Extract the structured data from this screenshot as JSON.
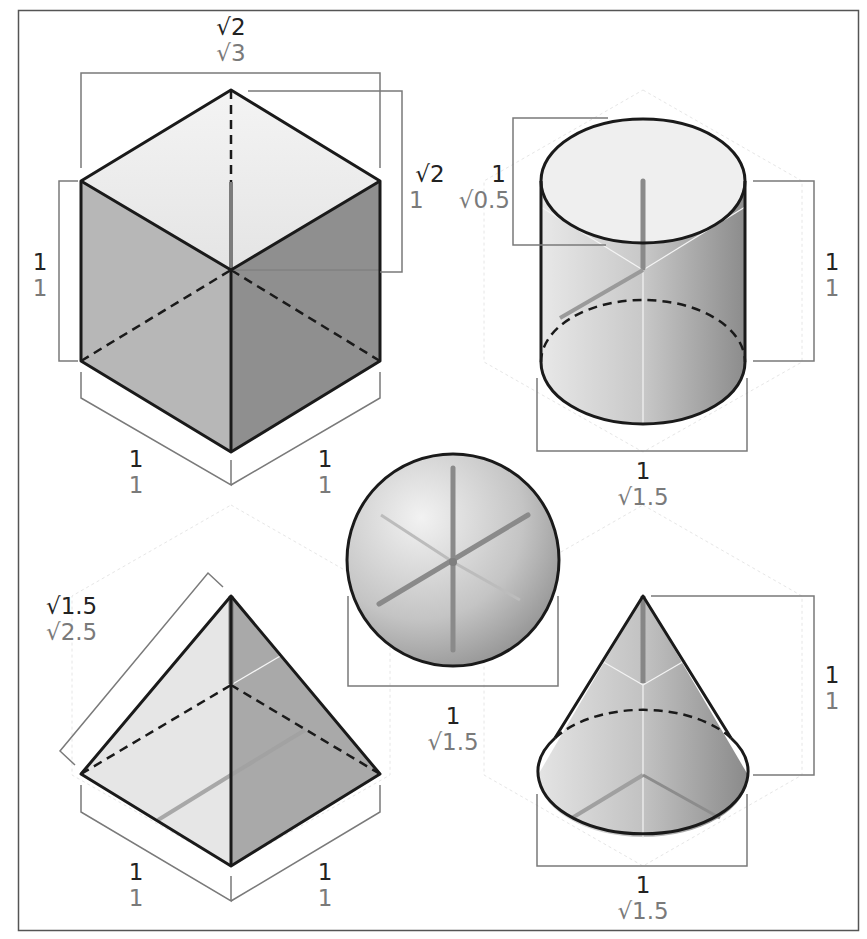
{
  "colors": {
    "frame": "#555555",
    "edge": "#1a1a1a",
    "dim_line": "#7a7a7a",
    "label_primary": "#222222",
    "label_secondary": "#7a7a7a",
    "face_light": "#ececec",
    "face_mid": "#b9b9b9",
    "face_dark": "#8f8f8f",
    "axis": "#8a8a8a"
  },
  "shapes": {
    "cube": {
      "name": "Cube",
      "top_dim": {
        "primary": "√2",
        "secondary": "√3"
      },
      "right_dim": {
        "primary": "√2",
        "secondary": "1"
      },
      "left_dim": {
        "primary": "1",
        "secondary": "1"
      },
      "bottom_left_dim": {
        "primary": "1",
        "secondary": "1"
      },
      "bottom_right_dim": {
        "primary": "1",
        "secondary": "1"
      }
    },
    "cylinder": {
      "name": "Cylinder",
      "top_left_dim": {
        "primary": "1",
        "secondary": "√0.5"
      },
      "right_dim": {
        "primary": "1",
        "secondary": "1"
      },
      "bottom_dim": {
        "primary": "1",
        "secondary": "√1.5"
      }
    },
    "sphere": {
      "name": "Sphere",
      "bottom_dim": {
        "primary": "1",
        "secondary": "√1.5"
      }
    },
    "pyramid": {
      "name": "Square pyramid",
      "slant_dim": {
        "primary": "√1.5",
        "secondary": "√2.5"
      },
      "bottom_left_dim": {
        "primary": "1",
        "secondary": "1"
      },
      "bottom_right_dim": {
        "primary": "1",
        "secondary": "1"
      }
    },
    "cone": {
      "name": "Cone",
      "right_dim": {
        "primary": "1",
        "secondary": "1"
      },
      "bottom_dim": {
        "primary": "1",
        "secondary": "√1.5"
      }
    }
  }
}
